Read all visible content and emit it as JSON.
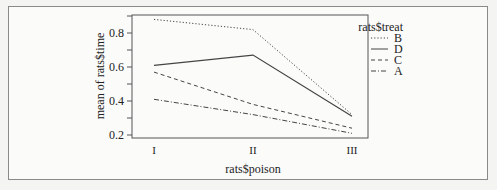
{
  "chart_data": {
    "type": "line",
    "title": "",
    "xlabel": "rats$poison",
    "ylabel": "mean of rats$time",
    "categories": [
      "I",
      "II",
      "III"
    ],
    "yticks": [
      "0.2",
      "0.4",
      "0.6",
      "0.8"
    ],
    "ylim": [
      0.2,
      0.9
    ],
    "legend_title": "rats$treat",
    "legend_position": "right",
    "grid": false,
    "series": [
      {
        "name": "B",
        "style": "dotted",
        "values": [
          0.88,
          0.82,
          0.32
        ]
      },
      {
        "name": "D",
        "style": "solid",
        "values": [
          0.61,
          0.67,
          0.31
        ]
      },
      {
        "name": "C",
        "style": "dashed",
        "values": [
          0.57,
          0.38,
          0.24
        ]
      },
      {
        "name": "A",
        "style": "dotdash",
        "values": [
          0.41,
          0.32,
          0.21
        ]
      }
    ]
  },
  "colors": {
    "line": "#444444",
    "axis": "#555555",
    "background": "#fbfbfa"
  }
}
